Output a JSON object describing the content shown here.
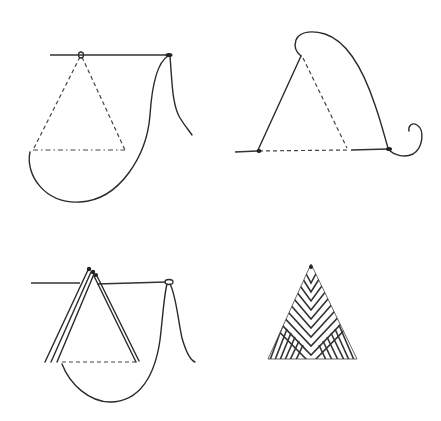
{
  "figure": {
    "colors": {
      "ink": "#2a2a2a",
      "background": "#ffffff"
    },
    "panels": [
      {
        "id": "step-1",
        "position": "top-left",
        "label": ""
      },
      {
        "id": "step-2",
        "position": "top-right",
        "label": ""
      },
      {
        "id": "step-3",
        "position": "bottom-left",
        "label": ""
      },
      {
        "id": "step-4",
        "position": "bottom-right",
        "label": ""
      }
    ]
  }
}
